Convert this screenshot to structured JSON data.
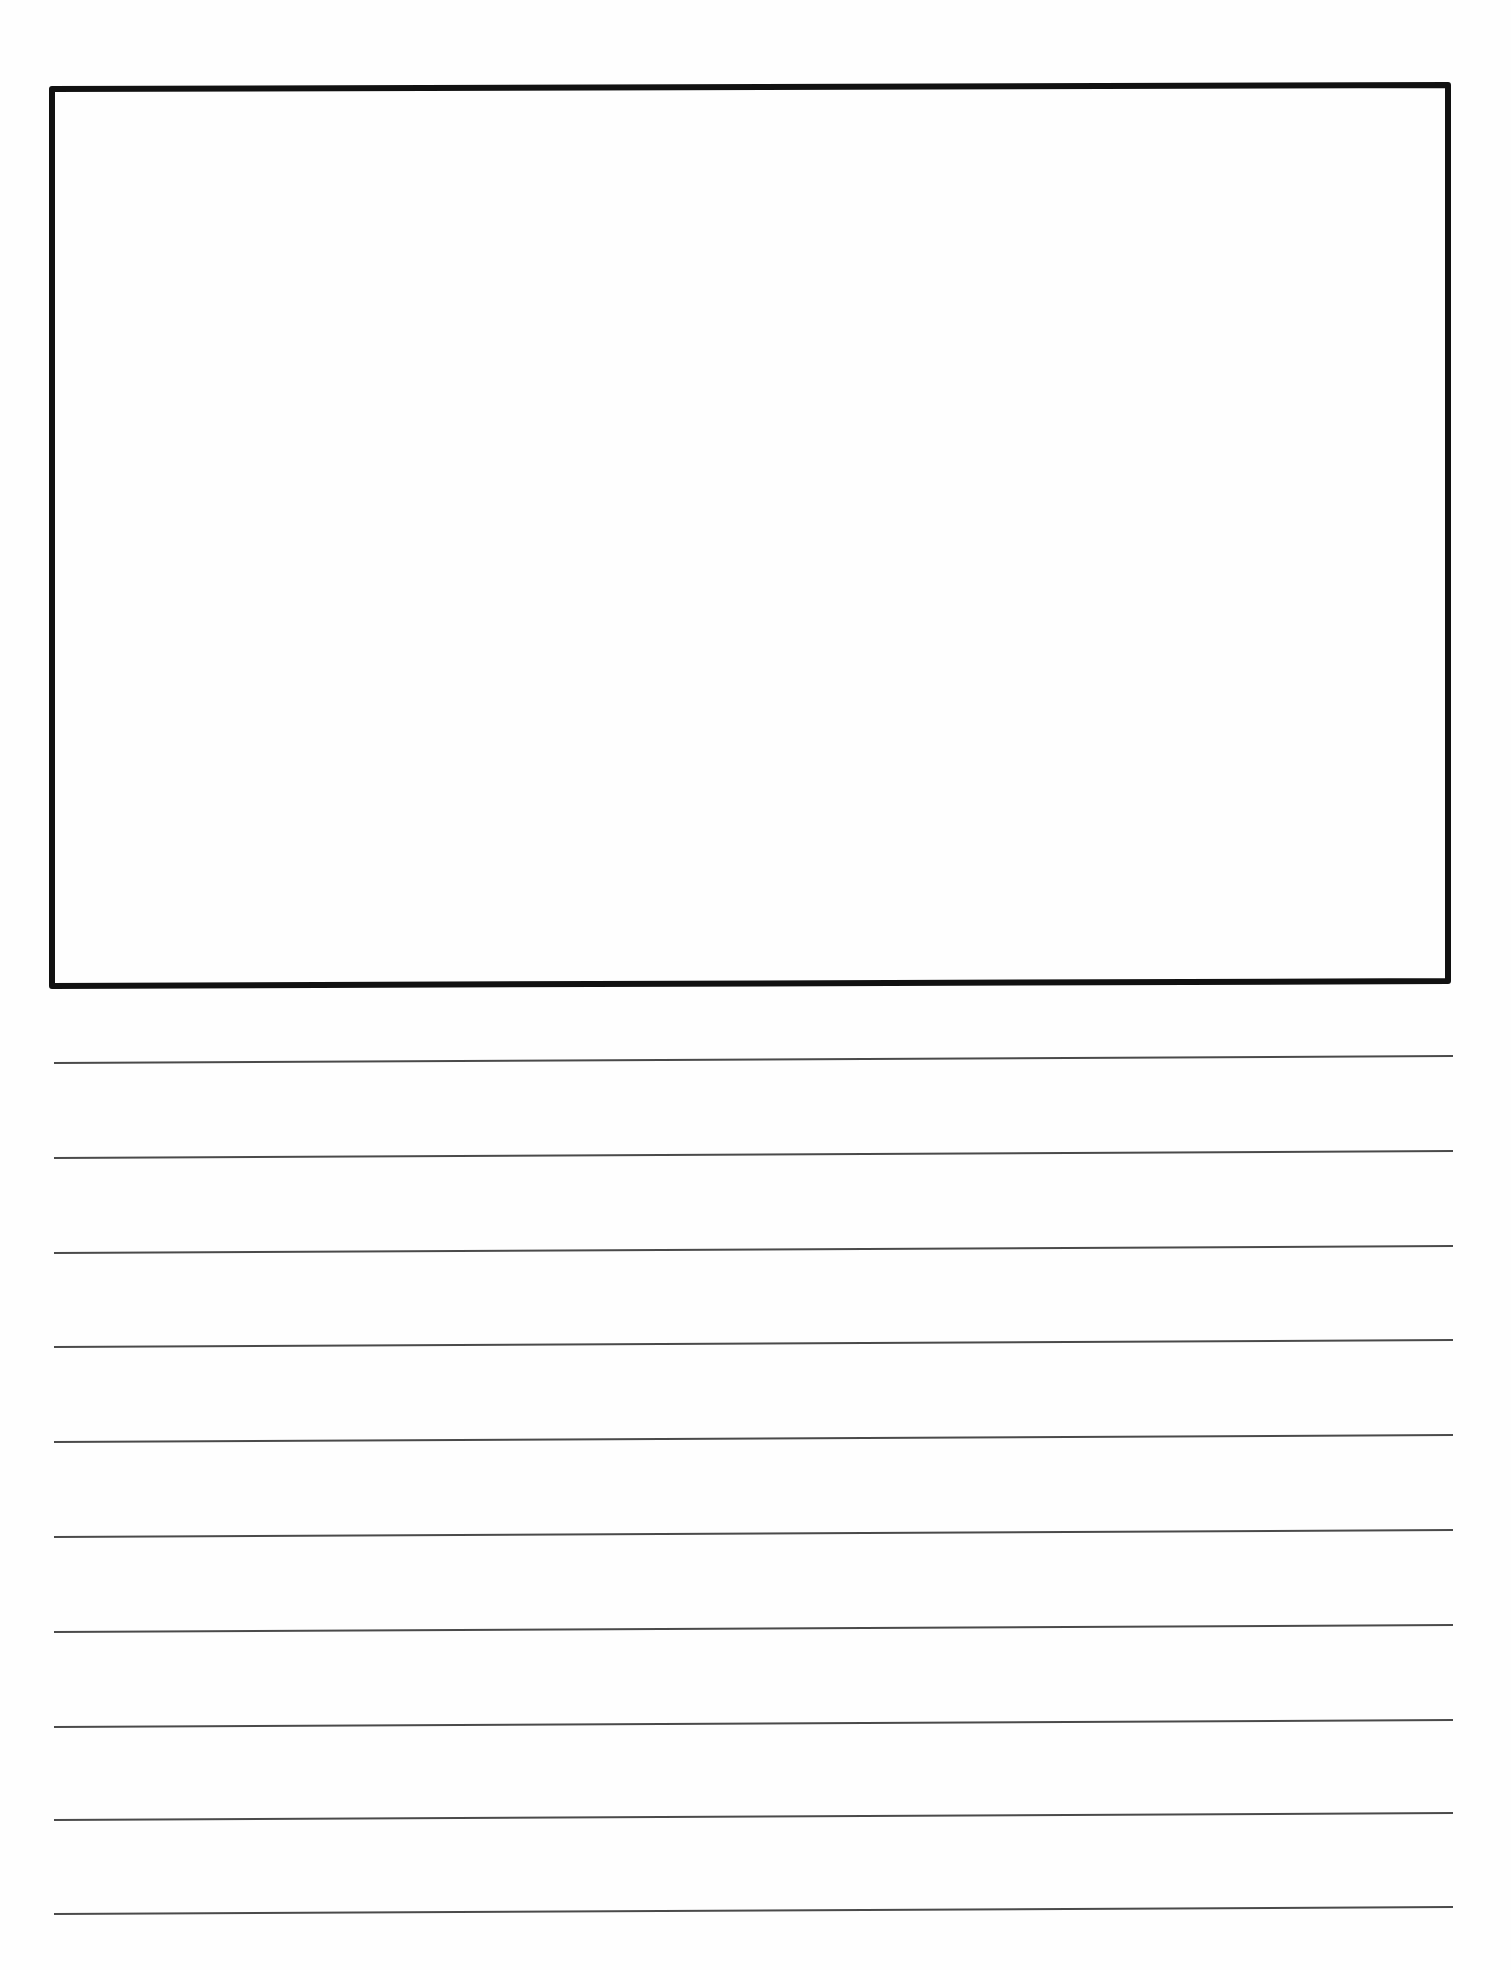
{
  "document": {
    "type": "primary writing paper with drawing box",
    "text_content": ""
  },
  "drawing_box": {
    "corners": {
      "top_left": [
        52,
        89
      ],
      "top_right": [
        1448,
        85
      ],
      "bottom_right": [
        1448,
        981
      ],
      "bottom_left": [
        52,
        986
      ]
    },
    "stroke_width": 6,
    "stroke_color": "#111111",
    "content": ""
  },
  "writing_lines": {
    "count": 10,
    "x_start": 54,
    "x_end": 1453,
    "rise_left_to_right": 7,
    "stroke_width": 2,
    "stroke_color": "#4a4a4a",
    "y_left": [
      1063,
      1158,
      1253,
      1347,
      1442,
      1537,
      1632,
      1727,
      1820,
      1914
    ]
  },
  "colors": {
    "paper": "#fefefe",
    "box_border": "#111111",
    "line": "#4a4a4a"
  }
}
